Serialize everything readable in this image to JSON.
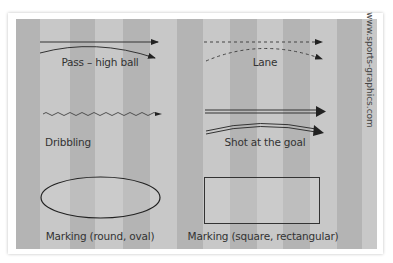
{
  "legend": {
    "items": [
      {
        "id": "pass-high-ball",
        "label": "Pass – high ball"
      },
      {
        "id": "lane",
        "label": "Lane"
      },
      {
        "id": "dribbling",
        "label": "Dribbling"
      },
      {
        "id": "shot-at-goal",
        "label": "Shot at the goal"
      },
      {
        "id": "marking-oval",
        "label": "Marking (round, oval)"
      },
      {
        "id": "marking-rect",
        "label": "Marking (square, rectangular)"
      }
    ],
    "credit": "www.sports-graphics.com"
  },
  "colors": {
    "stripe_dark": "#b4b4b4",
    "stripe_light": "#c8c8c8",
    "line": "#333333",
    "card": "#ffffff"
  }
}
